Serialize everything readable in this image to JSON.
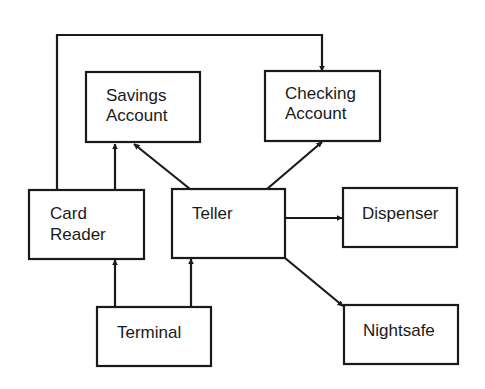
{
  "diagram": {
    "type": "block-diagram",
    "ink_color": "#1a1a1a",
    "background": "#ffffff",
    "nodes": [
      {
        "id": "savings",
        "lines": [
          "Savings",
          "Account"
        ]
      },
      {
        "id": "checking",
        "lines": [
          "Checking",
          "Account"
        ]
      },
      {
        "id": "card_reader",
        "lines": [
          "Card",
          "Reader"
        ]
      },
      {
        "id": "teller",
        "lines": [
          "Teller"
        ]
      },
      {
        "id": "dispenser",
        "lines": [
          "Dispenser"
        ]
      },
      {
        "id": "terminal",
        "lines": [
          "Terminal"
        ]
      },
      {
        "id": "nightsafe",
        "lines": [
          "Nightsafe"
        ]
      }
    ],
    "edges": [
      {
        "from": "card_reader",
        "to": "savings"
      },
      {
        "from": "card_reader",
        "to": "checking"
      },
      {
        "from": "teller",
        "to": "savings"
      },
      {
        "from": "teller",
        "to": "checking"
      },
      {
        "from": "teller",
        "to": "dispenser"
      },
      {
        "from": "teller",
        "to": "nightsafe"
      },
      {
        "from": "terminal",
        "to": "card_reader"
      },
      {
        "from": "terminal",
        "to": "teller"
      }
    ]
  }
}
